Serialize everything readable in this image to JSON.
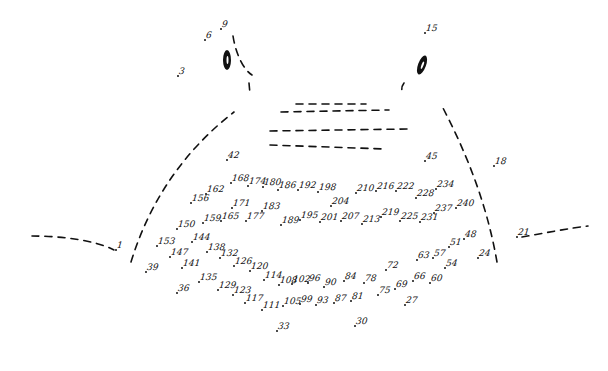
{
  "puzzle": {
    "type": "connect-the-dots",
    "ink_color": "#111111",
    "background": "#ffffff",
    "eyes": [
      {
        "cx": 227,
        "cy": 60,
        "rx": 4,
        "ry": 10,
        "rotate": 0
      },
      {
        "cx": 422,
        "cy": 65,
        "rx": 4,
        "ry": 10,
        "rotate": 20
      }
    ],
    "points": [
      {
        "n": "1",
        "x": 116,
        "y": 250
      },
      {
        "n": "3",
        "x": 178,
        "y": 76
      },
      {
        "n": "6",
        "x": 205,
        "y": 40
      },
      {
        "n": "9",
        "x": 221,
        "y": 29
      },
      {
        "n": "15",
        "x": 425,
        "y": 33
      },
      {
        "n": "18",
        "x": 494,
        "y": 166
      },
      {
        "n": "21",
        "x": 517,
        "y": 237
      },
      {
        "n": "24",
        "x": 478,
        "y": 258
      },
      {
        "n": "27",
        "x": 405,
        "y": 305
      },
      {
        "n": "30",
        "x": 355,
        "y": 326
      },
      {
        "n": "33",
        "x": 277,
        "y": 331
      },
      {
        "n": "36",
        "x": 177,
        "y": 293
      },
      {
        "n": "39",
        "x": 146,
        "y": 272
      },
      {
        "n": "42",
        "x": 227,
        "y": 160
      },
      {
        "n": "45",
        "x": 425,
        "y": 161
      },
      {
        "n": "48",
        "x": 464,
        "y": 239
      },
      {
        "n": "51",
        "x": 449,
        "y": 247
      },
      {
        "n": "54",
        "x": 445,
        "y": 268
      },
      {
        "n": "57",
        "x": 433,
        "y": 258
      },
      {
        "n": "60",
        "x": 430,
        "y": 283
      },
      {
        "n": "63",
        "x": 417,
        "y": 260
      },
      {
        "n": "66",
        "x": 413,
        "y": 281
      },
      {
        "n": "69",
        "x": 395,
        "y": 289
      },
      {
        "n": "72",
        "x": 386,
        "y": 270
      },
      {
        "n": "75",
        "x": 378,
        "y": 295
      },
      {
        "n": "78",
        "x": 364,
        "y": 283
      },
      {
        "n": "81",
        "x": 351,
        "y": 301
      },
      {
        "n": "84",
        "x": 344,
        "y": 281
      },
      {
        "n": "87",
        "x": 334,
        "y": 303
      },
      {
        "n": "90",
        "x": 324,
        "y": 287
      },
      {
        "n": "93",
        "x": 316,
        "y": 305
      },
      {
        "n": "96",
        "x": 308,
        "y": 283
      },
      {
        "n": "99",
        "x": 300,
        "y": 304
      },
      {
        "n": "102",
        "x": 292,
        "y": 284
      },
      {
        "n": "105",
        "x": 283,
        "y": 306
      },
      {
        "n": "108",
        "x": 279,
        "y": 285
      },
      {
        "n": "111",
        "x": 262,
        "y": 310
      },
      {
        "n": "114",
        "x": 264,
        "y": 280
      },
      {
        "n": "117",
        "x": 245,
        "y": 303
      },
      {
        "n": "120",
        "x": 250,
        "y": 271
      },
      {
        "n": "123",
        "x": 233,
        "y": 295
      },
      {
        "n": "126",
        "x": 234,
        "y": 266
      },
      {
        "n": "129",
        "x": 218,
        "y": 290
      },
      {
        "n": "132",
        "x": 220,
        "y": 258
      },
      {
        "n": "135",
        "x": 199,
        "y": 282
      },
      {
        "n": "138",
        "x": 207,
        "y": 252
      },
      {
        "n": "141",
        "x": 182,
        "y": 268
      },
      {
        "n": "144",
        "x": 192,
        "y": 242
      },
      {
        "n": "147",
        "x": 170,
        "y": 257
      },
      {
        "n": "150",
        "x": 177,
        "y": 229
      },
      {
        "n": "153",
        "x": 157,
        "y": 246
      },
      {
        "n": "156",
        "x": 191,
        "y": 203
      },
      {
        "n": "159",
        "x": 203,
        "y": 223
      },
      {
        "n": "162",
        "x": 206,
        "y": 194
      },
      {
        "n": "165",
        "x": 221,
        "y": 221
      },
      {
        "n": "168",
        "x": 231,
        "y": 183
      },
      {
        "n": "171",
        "x": 232,
        "y": 208
      },
      {
        "n": "174",
        "x": 248,
        "y": 186
      },
      {
        "n": "177",
        "x": 246,
        "y": 221
      },
      {
        "n": "180",
        "x": 263,
        "y": 187
      },
      {
        "n": "183",
        "x": 262,
        "y": 211
      },
      {
        "n": "186",
        "x": 278,
        "y": 190
      },
      {
        "n": "189",
        "x": 281,
        "y": 225
      },
      {
        "n": "192",
        "x": 298,
        "y": 190
      },
      {
        "n": "195",
        "x": 300,
        "y": 220
      },
      {
        "n": "198",
        "x": 318,
        "y": 192
      },
      {
        "n": "201",
        "x": 320,
        "y": 222
      },
      {
        "n": "204",
        "x": 331,
        "y": 206
      },
      {
        "n": "207",
        "x": 341,
        "y": 221
      },
      {
        "n": "210",
        "x": 356,
        "y": 193
      },
      {
        "n": "213",
        "x": 362,
        "y": 224
      },
      {
        "n": "216",
        "x": 376,
        "y": 191
      },
      {
        "n": "219",
        "x": 381,
        "y": 217
      },
      {
        "n": "222",
        "x": 396,
        "y": 191
      },
      {
        "n": "225",
        "x": 400,
        "y": 221
      },
      {
        "n": "228",
        "x": 416,
        "y": 198
      },
      {
        "n": "231",
        "x": 420,
        "y": 222
      },
      {
        "n": "234",
        "x": 436,
        "y": 189
      },
      {
        "n": "237",
        "x": 434,
        "y": 213
      },
      {
        "n": "240",
        "x": 456,
        "y": 208
      }
    ],
    "guide_lines": [
      {
        "name": "left-ground-line",
        "d": "M32,236 C60,236 95,240 114,250"
      },
      {
        "name": "right-ground-line",
        "d": "M522,237 C545,233 570,228 588,226"
      },
      {
        "name": "left-body-outline",
        "d": "M131,262 C150,200 185,150 234,112"
      },
      {
        "name": "right-body-outline",
        "d": "M497,262 C488,210 470,160 443,108"
      },
      {
        "name": "left-ear-inner",
        "d": "M233,36 C236,55 244,70 252,75"
      },
      {
        "name": "left-ear-stroke",
        "d": "M249,83 L250,94"
      },
      {
        "name": "right-ear-stroke",
        "d": "M404,83 C401,87 401,91 404,94"
      },
      {
        "name": "mouth-line-1",
        "d": "M296,104 L366,104"
      },
      {
        "name": "mouth-line-2",
        "d": "M281,112 L389,110"
      },
      {
        "name": "mouth-line-3",
        "d": "M270,131 L407,129"
      },
      {
        "name": "mouth-line-4",
        "d": "M270,145 L385,149"
      }
    ]
  }
}
